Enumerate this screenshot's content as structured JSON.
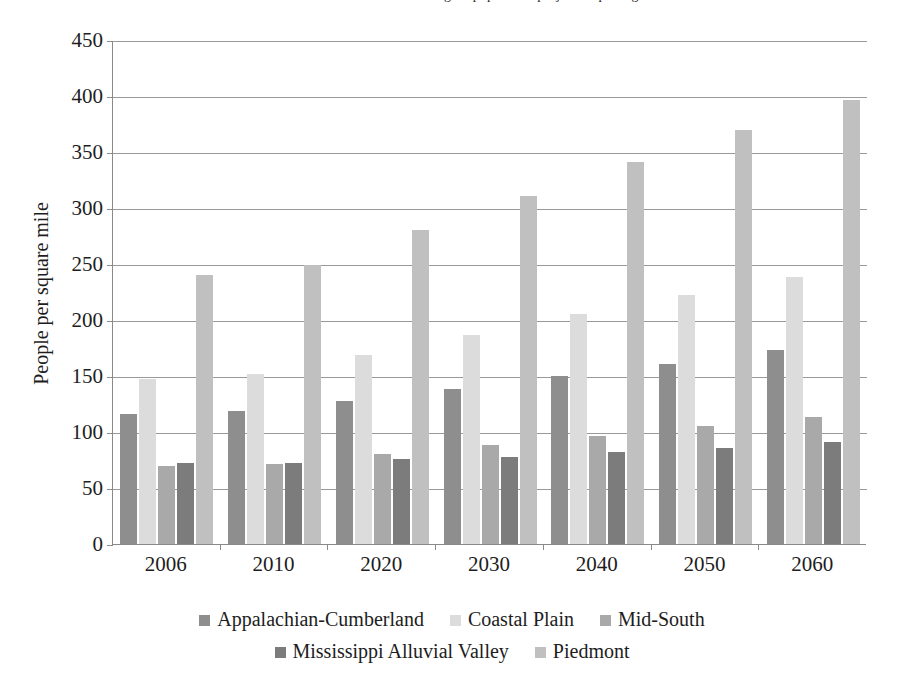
{
  "figure": {
    "cut_caption_fragment": "Figure  population  projection  per  region",
    "y_axis_title": "People per square mile"
  },
  "chart_data": {
    "type": "bar",
    "title": "",
    "xlabel": "",
    "ylabel": "People per square mile",
    "ylim": [
      0,
      450
    ],
    "ytick_step": 50,
    "yticks": [
      0,
      50,
      100,
      150,
      200,
      250,
      300,
      350,
      400,
      450
    ],
    "grid": true,
    "legend_position": "bottom",
    "categories": [
      "2006",
      "2010",
      "2020",
      "2030",
      "2040",
      "2050",
      "2060"
    ],
    "series": [
      {
        "name": "Appalachian-Cumberland",
        "color": "#8e8e8e",
        "values": [
          116,
          119,
          128,
          138,
          150,
          161,
          173
        ]
      },
      {
        "name": "Coastal Plain",
        "color": "#dcdcdc",
        "values": [
          147,
          152,
          169,
          187,
          205,
          222,
          238
        ]
      },
      {
        "name": "Mid-South",
        "color": "#a9a9a9",
        "values": [
          70,
          71,
          80,
          88,
          96,
          105,
          113
        ]
      },
      {
        "name": "Mississippi Alluvial Valley",
        "color": "#7c7c7c",
        "values": [
          72,
          72,
          76,
          78,
          82,
          86,
          91
        ]
      },
      {
        "name": "Piedmont",
        "color": "#c0c0c0",
        "values": [
          240,
          249,
          280,
          311,
          341,
          370,
          396
        ]
      }
    ]
  }
}
